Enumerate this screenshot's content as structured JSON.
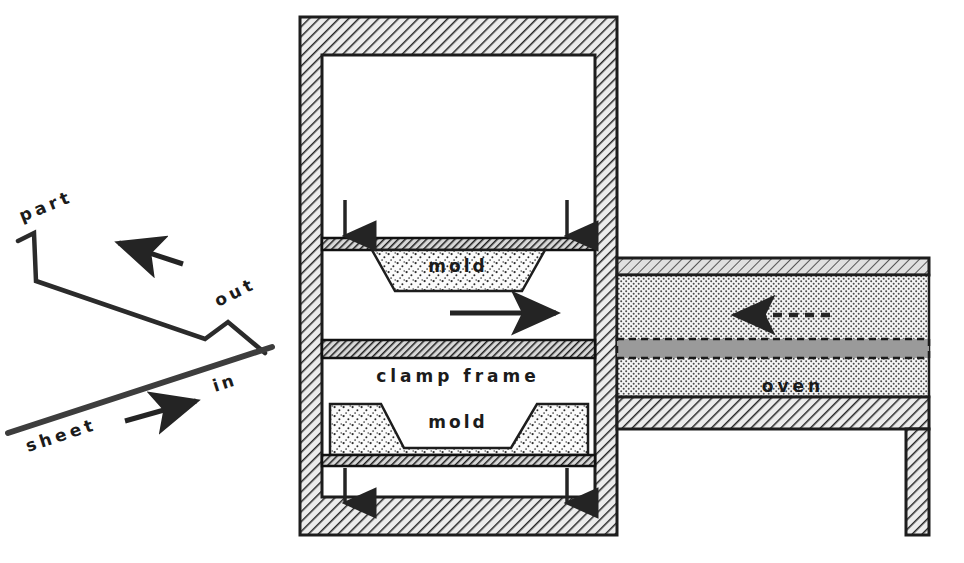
{
  "diagram": {
    "colors": {
      "ink": "#242424",
      "hatch_fill": "#e8e8e8",
      "stipple_fill": "#f2f2f2",
      "oven_fill": "#e3e3e3",
      "sheet_band": "#9a9a9a",
      "platen": "#3a3a3a",
      "page": "#ffffff"
    },
    "left_section": {
      "name": "part and sheet travel paths",
      "labels": {
        "part": "part",
        "out": "out",
        "sheet": "sheet",
        "in": "in"
      },
      "arrows": {
        "part_out_direction": "left",
        "sheet_in_direction": "right"
      }
    },
    "press": {
      "name": "clamp press frame",
      "upper_mold_label": "mold",
      "lower_mold_label": "mold",
      "clamp_frame_label": "clamp frame",
      "close_arrows": {
        "top_count": 2,
        "top_direction": "down",
        "bottom_count": 2,
        "bottom_direction": "up"
      },
      "transfer_arrow_direction": "right"
    },
    "oven": {
      "name": "oven",
      "label": "oven",
      "sheet_arrow_direction": "left",
      "sheet_arrow_style": "dashed"
    }
  }
}
